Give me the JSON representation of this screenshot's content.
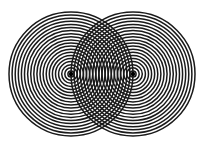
{
  "diagram": {
    "type": "two-source-interference",
    "background": "#ffffff",
    "ring_color": "#1a1a1a",
    "source_color": "#000000",
    "ring_spacing": 3.1,
    "ring_stroke": 1.5,
    "ring_count": 20,
    "sources": [
      {
        "id": "left-source",
        "cx": 71,
        "cy": 74
      },
      {
        "id": "right-source",
        "cx": 133,
        "cy": 74
      }
    ]
  }
}
